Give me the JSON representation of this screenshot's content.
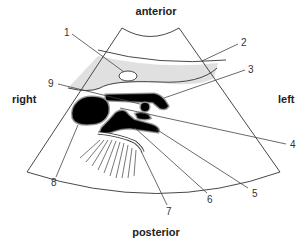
{
  "diagram": {
    "type": "ultrasound-sector-schematic",
    "orientation_labels": {
      "top": "anterior",
      "bottom": "posterior",
      "left": "right",
      "right": "left"
    },
    "callouts": [
      {
        "id": "1",
        "label": "1",
        "target": "small oval structure in grey layer"
      },
      {
        "id": "2",
        "label": "2",
        "target": "grey curved band (superficial layer)"
      },
      {
        "id": "3",
        "label": "3",
        "target": "elongated black structure (top)"
      },
      {
        "id": "4",
        "label": "4",
        "target": "small round black vessel"
      },
      {
        "id": "5",
        "label": "5",
        "target": "lower elongated black structure"
      },
      {
        "id": "6",
        "label": "6",
        "target": "central black structure"
      },
      {
        "id": "7",
        "label": "7",
        "target": "curved echogenic line with acoustic shadow"
      },
      {
        "id": "8",
        "label": "8",
        "target": "large black oval structure (right)"
      },
      {
        "id": "9",
        "label": "9",
        "target": "bottom edge of grey layer"
      }
    ],
    "colors": {
      "background": "#ffffff",
      "grey_layer": "#e0e0e0",
      "organ_fill": "#000000",
      "outline": "#333333"
    }
  }
}
